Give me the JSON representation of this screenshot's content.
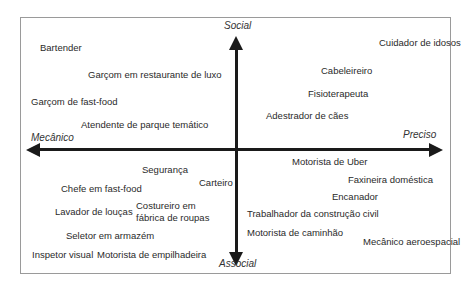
{
  "diagram": {
    "axes": {
      "top": "Social",
      "bottom": "Associal",
      "left": "Mecânico",
      "right": "Preciso"
    },
    "items": [
      {
        "label": "Bartender",
        "x": 40,
        "y": 42
      },
      {
        "label": "Garçom em restaurante de luxo",
        "x": 88,
        "y": 69
      },
      {
        "label": "Garçom de fast-food",
        "x": 31,
        "y": 96
      },
      {
        "label": "Atendente de parque temático",
        "x": 81,
        "y": 119
      },
      {
        "label": "Cuidador de idosos",
        "x": 379,
        "y": 37
      },
      {
        "label": "Cabeleireiro",
        "x": 321,
        "y": 65
      },
      {
        "label": "Fisioterapeuta",
        "x": 308,
        "y": 88
      },
      {
        "label": "Adestrador de cães",
        "x": 266,
        "y": 110
      },
      {
        "label": "Segurança",
        "x": 142,
        "y": 164
      },
      {
        "label": "Carteiro",
        "x": 199,
        "y": 177
      },
      {
        "label": "Chefe em fast-food",
        "x": 61,
        "y": 183
      },
      {
        "label": "Lavador de louças",
        "x": 55,
        "y": 206
      },
      {
        "label": "Costureiro em fábrica de roupas",
        "x": 136,
        "y": 200
      },
      {
        "label": "Seletor em armazém",
        "x": 66,
        "y": 230
      },
      {
        "label": "Inspetor visual",
        "x": 32,
        "y": 249
      },
      {
        "label": "Motorista de empilhadeira",
        "x": 97,
        "y": 249
      },
      {
        "label": "Motorista de Uber",
        "x": 292,
        "y": 156
      },
      {
        "label": "Faxineira doméstica",
        "x": 348,
        "y": 174
      },
      {
        "label": "Encanador",
        "x": 332,
        "y": 191
      },
      {
        "label": "Trabalhador da construção civil",
        "x": 247,
        "y": 208
      },
      {
        "label": "Motorista de caminhão",
        "x": 247,
        "y": 227
      },
      {
        "label": "Mecânico aeroespacial",
        "x": 363,
        "y": 236
      }
    ]
  }
}
